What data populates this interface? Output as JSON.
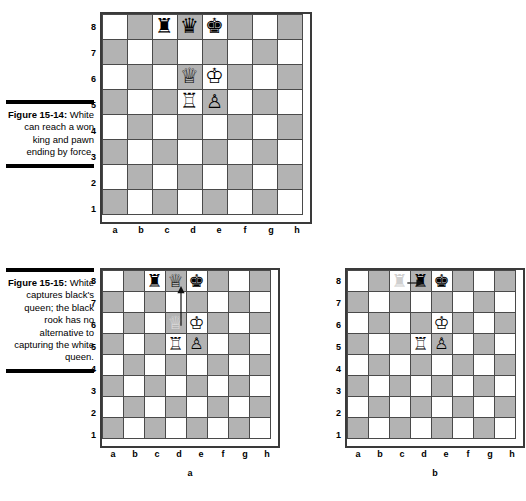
{
  "page": {
    "width": 526,
    "height": 501,
    "background": "#ffffff",
    "light_square_color": "#ffffff",
    "dark_square_color": "#b3b3b3",
    "border_color": "#3a3a3a",
    "ghost_piece_color": "#cfcfcf"
  },
  "figures": [
    {
      "id": "figure-15-14",
      "caption_title": "Figure 15-14:",
      "caption_text": "White can reach a won king and pawn ending by force.",
      "boards": [
        {
          "id": "board-15-14",
          "sub_label": "",
          "rank_labels": [
            "8",
            "7",
            "6",
            "5",
            "4",
            "3",
            "2",
            "1"
          ],
          "file_labels": [
            "a",
            "b",
            "c",
            "d",
            "e",
            "f",
            "g",
            "h"
          ],
          "pieces": [
            {
              "square": "c8",
              "color": "black",
              "type": "rook",
              "glyph": "♜",
              "state": "normal"
            },
            {
              "square": "d8",
              "color": "black",
              "type": "queen",
              "glyph": "♛",
              "state": "normal"
            },
            {
              "square": "e8",
              "color": "black",
              "type": "king",
              "glyph": "♚",
              "state": "normal"
            },
            {
              "square": "d6",
              "color": "white",
              "type": "queen",
              "glyph": "♕",
              "state": "normal"
            },
            {
              "square": "e6",
              "color": "white",
              "type": "king",
              "glyph": "♔",
              "state": "normal"
            },
            {
              "square": "d5",
              "color": "white",
              "type": "rook",
              "glyph": "♖",
              "state": "normal"
            },
            {
              "square": "e5",
              "color": "white",
              "type": "pawn",
              "glyph": "♙",
              "state": "normal"
            }
          ],
          "arrows": []
        }
      ]
    },
    {
      "id": "figure-15-15",
      "caption_title": "Figure 15-15:",
      "caption_text": "White captures black's queen; the black rook has no alternative to capturing the white queen.",
      "boards": [
        {
          "id": "board-15-15a",
          "sub_label": "a",
          "rank_labels": [
            "8",
            "7",
            "6",
            "5",
            "4",
            "3",
            "2",
            "1"
          ],
          "file_labels": [
            "a",
            "b",
            "c",
            "d",
            "e",
            "f",
            "g",
            "h"
          ],
          "pieces": [
            {
              "square": "c8",
              "color": "black",
              "type": "rook",
              "glyph": "♜",
              "state": "normal"
            },
            {
              "square": "d8",
              "color": "white",
              "type": "queen",
              "glyph": "♕",
              "state": "normal"
            },
            {
              "square": "e8",
              "color": "black",
              "type": "king",
              "glyph": "♚",
              "state": "normal"
            },
            {
              "square": "d6",
              "color": "white",
              "type": "queen",
              "glyph": "♕",
              "state": "ghost"
            },
            {
              "square": "e6",
              "color": "white",
              "type": "king",
              "glyph": "♔",
              "state": "normal"
            },
            {
              "square": "d5",
              "color": "white",
              "type": "rook",
              "glyph": "♖",
              "state": "normal"
            },
            {
              "square": "e5",
              "color": "white",
              "type": "pawn",
              "glyph": "♙",
              "state": "normal"
            }
          ],
          "arrows": [
            {
              "from": "d6",
              "to": "d8",
              "direction": "up",
              "label": "white-queen-captures-d8"
            }
          ]
        },
        {
          "id": "board-15-15b",
          "sub_label": "b",
          "rank_labels": [
            "8",
            "7",
            "6",
            "5",
            "4",
            "3",
            "2",
            "1"
          ],
          "file_labels": [
            "a",
            "b",
            "c",
            "d",
            "e",
            "f",
            "g",
            "h"
          ],
          "pieces": [
            {
              "square": "c8",
              "color": "black",
              "type": "rook",
              "glyph": "♜",
              "state": "ghost"
            },
            {
              "square": "d8",
              "color": "black",
              "type": "rook",
              "glyph": "♜",
              "state": "normal"
            },
            {
              "square": "e8",
              "color": "black",
              "type": "king",
              "glyph": "♚",
              "state": "normal"
            },
            {
              "square": "e6",
              "color": "white",
              "type": "king",
              "glyph": "♔",
              "state": "normal"
            },
            {
              "square": "d5",
              "color": "white",
              "type": "rook",
              "glyph": "♖",
              "state": "normal"
            },
            {
              "square": "e5",
              "color": "white",
              "type": "pawn",
              "glyph": "♙",
              "state": "normal"
            }
          ],
          "arrows": [
            {
              "from": "c8",
              "to": "d8",
              "direction": "right",
              "label": "black-rook-recaptures-d8"
            }
          ]
        }
      ]
    }
  ]
}
